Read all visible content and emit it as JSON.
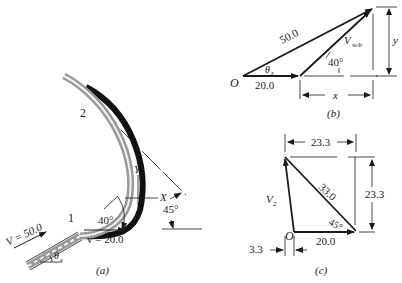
{
  "figure_a": {
    "caption": "(a)",
    "point_1": "1",
    "point_2": "2",
    "inlet_velocity": "V = 50.0",
    "blade_velocity": "v = 20.0",
    "angle_40": "40°",
    "angle_45": "45°",
    "theta_label": "θ",
    "theta_sub": "s",
    "axis_x": "X",
    "axis_y": "Y"
  },
  "figure_b": {
    "caption": "(b)",
    "origin": "O",
    "hyp_label": "50.0",
    "base_label": "20.0",
    "rel_label": "V",
    "rel_sub": "w/b",
    "angle_40": "40°",
    "theta_label": "θ",
    "theta_sub": "s",
    "dim_x": "x",
    "dim_y": "y"
  },
  "figure_c": {
    "caption": "(c)",
    "origin": "O",
    "top_dim": "23.3",
    "right_dim": "23.3",
    "hyp_label": "33.0",
    "base_label": "20.0",
    "angle_45": "45°",
    "v2_label": "V",
    "v2_sub": "2",
    "offset_dim": "3.3"
  }
}
